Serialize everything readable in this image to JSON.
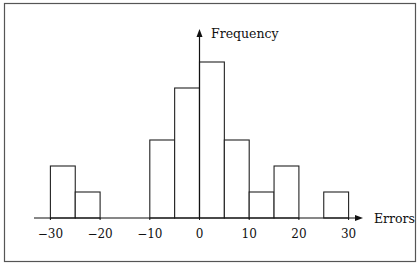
{
  "chart_data": {
    "type": "bar",
    "subtype": "histogram",
    "title": "",
    "xlabel": "Errors",
    "ylabel": "Frequency",
    "bin_width": 5,
    "bins": [
      {
        "from": -30,
        "to": -25,
        "value": 2
      },
      {
        "from": -25,
        "to": -20,
        "value": 1
      },
      {
        "from": -20,
        "to": -15,
        "value": 0
      },
      {
        "from": -15,
        "to": -10,
        "value": 0
      },
      {
        "from": -10,
        "to": -5,
        "value": 3
      },
      {
        "from": -5,
        "to": 0,
        "value": 5
      },
      {
        "from": 0,
        "to": 5,
        "value": 6
      },
      {
        "from": 5,
        "to": 10,
        "value": 3
      },
      {
        "from": 10,
        "to": 15,
        "value": 1
      },
      {
        "from": 15,
        "to": 20,
        "value": 2
      },
      {
        "from": 20,
        "to": 25,
        "value": 0
      },
      {
        "from": 25,
        "to": 30,
        "value": 1
      }
    ],
    "categories": [
      "-30 to -25",
      "-25 to -20",
      "-20 to -15",
      "-15 to -10",
      "-10 to -5",
      "-5 to 0",
      "0 to 5",
      "5 to 10",
      "10 to 15",
      "15 to 20",
      "20 to 25",
      "25 to 30"
    ],
    "values": [
      2,
      1,
      0,
      0,
      3,
      5,
      6,
      3,
      1,
      2,
      0,
      1
    ],
    "x_ticks": [
      -30,
      -20,
      -10,
      0,
      10,
      20,
      30
    ],
    "x_tick_labels": [
      "−30",
      "−20",
      "−10",
      "0",
      "10",
      "20",
      "30"
    ],
    "xlim": [
      -33,
      33
    ],
    "ylim": [
      0,
      7
    ],
    "y_ticks": [],
    "grid": false,
    "legend": null,
    "colors": {
      "bar_fill": "#ffffff",
      "bar_stroke": "#222222",
      "axis": "#111111",
      "frame": "#555555"
    }
  }
}
